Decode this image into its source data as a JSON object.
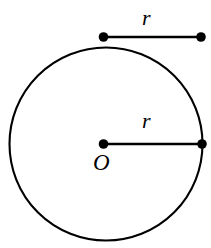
{
  "figure": {
    "background_color": "#ffffff",
    "stroke_color": "#000000",
    "width": 211,
    "height": 248,
    "labels": {
      "chord_r": "r",
      "radius_r": "r",
      "center_o": "O"
    },
    "geometry": {
      "circle": {
        "name": "circle-outline",
        "cx": 106,
        "cy": 144,
        "r": 96.5,
        "stroke_width": 2.1,
        "fill": "none"
      },
      "radius_segment": {
        "name": "radius-segment",
        "x1": 103.5,
        "y1": 144,
        "x2": 202,
        "y2": 144,
        "stroke_width": 2.4
      },
      "chord_segment": {
        "name": "measure-segment",
        "x1": 103.5,
        "y1": 37,
        "x2": 201,
        "y2": 37,
        "stroke_width": 2.4
      },
      "points": [
        {
          "name": "center-point",
          "cx": 103.5,
          "cy": 144,
          "r": 4.8
        },
        {
          "name": "radius-endpoint",
          "cx": 202,
          "cy": 144,
          "r": 4.8
        },
        {
          "name": "measure-left-endpoint",
          "cx": 103.5,
          "cy": 37,
          "r": 4.8
        },
        {
          "name": "measure-right-endpoint",
          "cx": 201,
          "cy": 37,
          "r": 4.8
        }
      ]
    }
  }
}
